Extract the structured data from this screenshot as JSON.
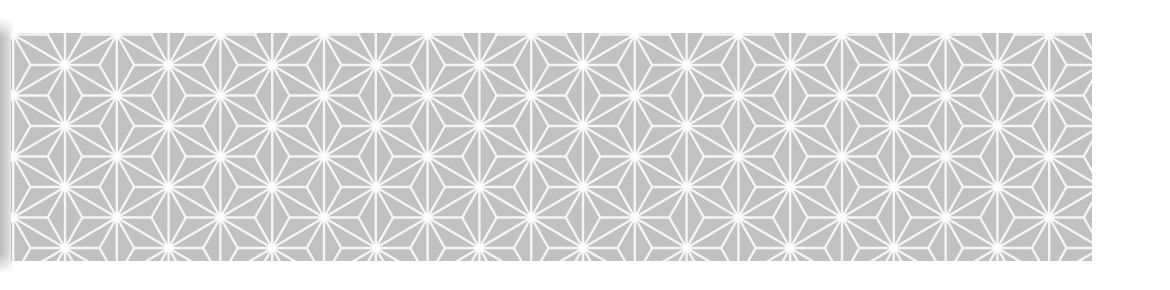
{
  "image": {
    "description": "Asanoha (hemp leaf) geometric pattern swatch",
    "pattern_name": "asanoha"
  },
  "panel": {
    "x": 11,
    "y": 33,
    "width": 1081,
    "height": 228,
    "background_color": "#c1c1c1",
    "line_color": "#f5f5f5",
    "line_width": 2.4,
    "star_glow_color": "#ffffff"
  },
  "lattice": {
    "origin_x": 65,
    "origin_y": 65,
    "column_step": 51.8,
    "row_pitch": 61,
    "odd_column_offset": -30.5
  }
}
